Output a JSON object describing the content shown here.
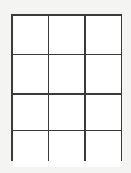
{
  "figure": {
    "kind": "empty-grid-table",
    "columns": 3,
    "rows": 4,
    "colors": {
      "background": "#f4f4f3",
      "cell_fill": "#ffffff",
      "line": "#3a3a3a"
    },
    "cells": [
      {
        "row": 1,
        "col": 1,
        "text": ""
      },
      {
        "row": 1,
        "col": 2,
        "text": ""
      },
      {
        "row": 1,
        "col": 3,
        "text": ""
      },
      {
        "row": 2,
        "col": 1,
        "text": ""
      },
      {
        "row": 2,
        "col": 2,
        "text": ""
      },
      {
        "row": 2,
        "col": 3,
        "text": ""
      },
      {
        "row": 3,
        "col": 1,
        "text": ""
      },
      {
        "row": 3,
        "col": 2,
        "text": ""
      },
      {
        "row": 3,
        "col": 3,
        "text": ""
      },
      {
        "row": 4,
        "col": 1,
        "text": ""
      },
      {
        "row": 4,
        "col": 2,
        "text": ""
      },
      {
        "row": 4,
        "col": 3,
        "text": ""
      }
    ]
  }
}
